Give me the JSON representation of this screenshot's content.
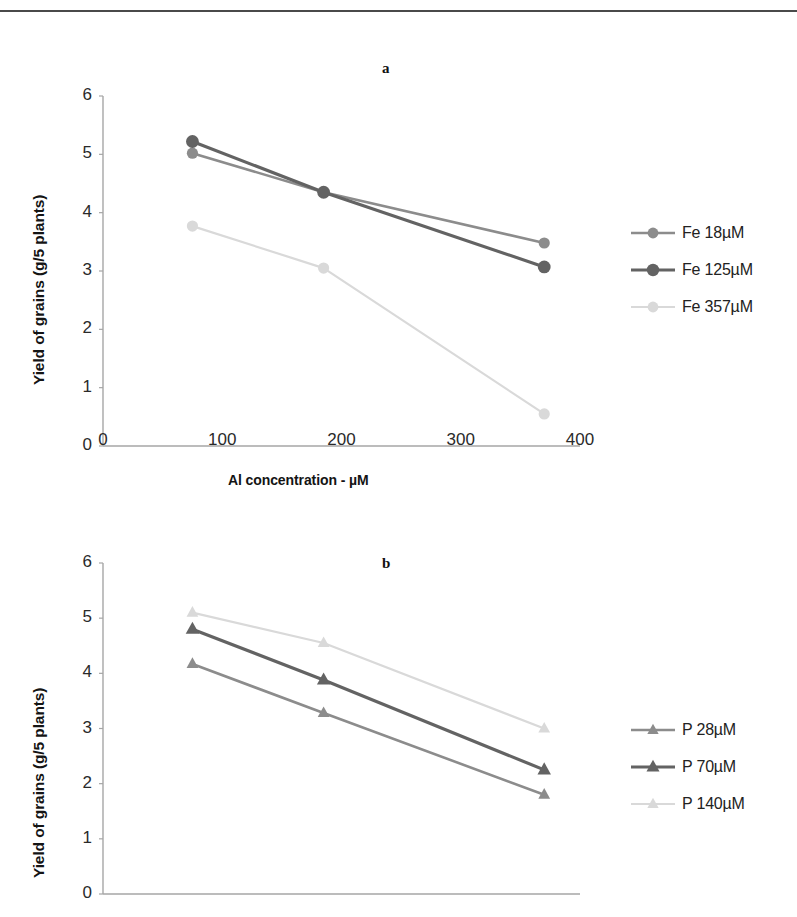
{
  "page": {
    "background": "#ffffff",
    "rule_color": "#4a4a4a"
  },
  "colors": {
    "series_medium": "#8c8c8c",
    "series_dark": "#636363",
    "series_light": "#d9d9d9",
    "axis": "#a6a6a6",
    "text": "#1a1a1a"
  },
  "chart_data": [
    {
      "type": "line",
      "panel": "a",
      "title": "a",
      "xlabel": "Al concentration  -  µM",
      "ylabel": "Yield of grains (g/5 plants)",
      "x": [
        75,
        185,
        370
      ],
      "xlim": [
        0,
        400
      ],
      "ylim": [
        0,
        6
      ],
      "xticks": [
        0,
        100,
        200,
        300,
        400
      ],
      "yticks": [
        0,
        1,
        2,
        3,
        4,
        5,
        6
      ],
      "xtick_labels": [
        "0",
        "100",
        "200",
        "300",
        "400"
      ],
      "ytick_labels": [
        "0",
        "1",
        "2",
        "3",
        "4",
        "5",
        "6"
      ],
      "grid": false,
      "marker": "circle",
      "legend_position": "right",
      "series": [
        {
          "name": "Fe 18µM",
          "values": [
            5.02,
            4.35,
            3.48
          ],
          "color": "#8c8c8c"
        },
        {
          "name": "Fe 125µM",
          "values": [
            5.22,
            4.35,
            3.07
          ],
          "color": "#636363"
        },
        {
          "name": "Fe 357µM",
          "values": [
            3.77,
            3.05,
            0.55
          ],
          "color": "#d9d9d9"
        }
      ]
    },
    {
      "type": "line",
      "panel": "b",
      "title": "b",
      "xlabel": "",
      "ylabel": "Yield of grains (g/5 plants)",
      "x": [
        75,
        185,
        370
      ],
      "xlim": [
        0,
        400
      ],
      "ylim": [
        0,
        6
      ],
      "xticks": [
        0,
        100,
        200,
        300,
        400
      ],
      "yticks": [
        0,
        1,
        2,
        3,
        4,
        5,
        6
      ],
      "xtick_labels": [],
      "ytick_labels": [
        "0",
        "1",
        "2",
        "3",
        "4",
        "5",
        "6"
      ],
      "grid": false,
      "marker": "triangle",
      "legend_position": "right",
      "series": [
        {
          "name": "P 28µM",
          "values": [
            4.17,
            3.28,
            1.8
          ],
          "color": "#8c8c8c"
        },
        {
          "name": "P 70µM",
          "values": [
            4.8,
            3.88,
            2.25
          ],
          "color": "#636363"
        },
        {
          "name": "P 140µM",
          "values": [
            5.1,
            4.55,
            3.0
          ],
          "color": "#d9d9d9"
        }
      ]
    }
  ],
  "figure_a": {
    "panel_label": "a",
    "y_axis_title": "Yield of grains (g/5 plants)",
    "x_axis_title": "Al concentration  -  µM",
    "y_ticks": [
      "6",
      "5",
      "4",
      "3",
      "2",
      "1",
      "0"
    ],
    "x_ticks": [
      "0",
      "100",
      "200",
      "300",
      "400"
    ],
    "legend": [
      {
        "label": "Fe 18µM",
        "color": "#8c8c8c",
        "marker": "circle"
      },
      {
        "label": "Fe 125µM",
        "color": "#636363",
        "marker": "circle"
      },
      {
        "label": "Fe 357µM",
        "color": "#d9d9d9",
        "marker": "circle"
      }
    ]
  },
  "figure_b": {
    "panel_label": "b",
    "y_axis_title": "Yield of grains (g/5 plants)",
    "x_axis_title": "",
    "y_ticks": [
      "6",
      "5",
      "4",
      "3",
      "2",
      "1",
      "0"
    ],
    "x_ticks": [],
    "legend": [
      {
        "label": "P 28µM",
        "color": "#8c8c8c",
        "marker": "triangle"
      },
      {
        "label": "P 70µM",
        "color": "#636363",
        "marker": "triangle"
      },
      {
        "label": "P 140µM",
        "color": "#d9d9d9",
        "marker": "triangle"
      }
    ]
  }
}
